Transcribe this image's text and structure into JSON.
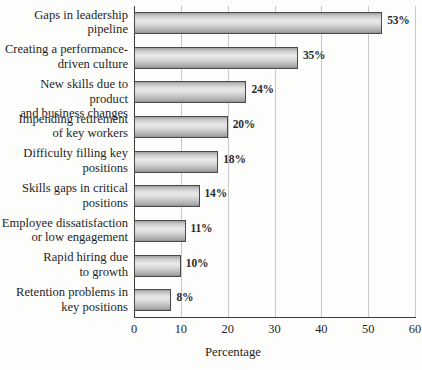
{
  "chart_data": {
    "type": "bar",
    "orientation": "horizontal",
    "title": "",
    "xlabel": "Percentage",
    "ylabel": "",
    "xlim": [
      0,
      60
    ],
    "xticks": [
      0,
      10,
      20,
      30,
      40,
      50,
      60
    ],
    "xtick_labels": [
      "0",
      "10",
      "20",
      "30",
      "40",
      "50",
      "60"
    ],
    "grid": true,
    "legend": false,
    "value_suffix": "%",
    "categories": [
      "Gaps in leadership\npipeline",
      "Creating a performance-\ndriven culture",
      "New skills due to product\nand business changes",
      "Impending retirement\nof key workers",
      "Difficulty filling key\npositions",
      "Skills gaps in critical\npositions",
      "Employee dissatisfaction\nor low engagement",
      "Rapid hiring due\nto growth",
      "Retention problems in\nkey positions"
    ],
    "values": [
      53,
      35,
      24,
      20,
      18,
      14,
      11,
      10,
      8
    ],
    "value_labels": [
      "53%",
      "35%",
      "24%",
      "20%",
      "18%",
      "14%",
      "11%",
      "10%",
      "8%"
    ],
    "colors": {
      "bar_fill_light": "#e9e9e9",
      "bar_fill_dark": "#8f8f8f",
      "bar_border": "#4a4a4a",
      "gridline": "#c9c9c9",
      "axis": "#3b3b3b",
      "text": "#1f1f1f",
      "background": "#fdfdfb"
    }
  }
}
